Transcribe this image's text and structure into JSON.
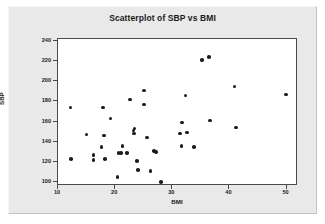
{
  "chart_data": {
    "type": "scatter",
    "title": "Scatterplot of SBP vs BMI",
    "xlabel": "BMI",
    "ylabel": "SBP",
    "xlim": [
      10,
      52
    ],
    "ylim": [
      96,
      242
    ],
    "xticks": [
      10,
      20,
      30,
      40,
      50
    ],
    "yticks": [
      100,
      120,
      140,
      160,
      180,
      200,
      220,
      240
    ],
    "grid": false,
    "legend": null,
    "marker_color": "#1c1c1c",
    "points": [
      {
        "x": 12.2,
        "y": 174
      },
      {
        "x": 12.3,
        "y": 123
      },
      {
        "x": 15.0,
        "y": 147
      },
      {
        "x": 16.2,
        "y": 127
      },
      {
        "x": 16.2,
        "y": 122
      },
      {
        "x": 17.6,
        "y": 135
      },
      {
        "x": 17.9,
        "y": 174
      },
      {
        "x": 18.0,
        "y": 146
      },
      {
        "x": 18.2,
        "y": 123
      },
      {
        "x": 19.2,
        "y": 163
      },
      {
        "x": 20.4,
        "y": 105
      },
      {
        "x": 20.6,
        "y": 129
      },
      {
        "x": 21.0,
        "y": 129
      },
      {
        "x": 21.3,
        "y": 136
      },
      {
        "x": 22.1,
        "y": 129
      },
      {
        "x": 22.6,
        "y": 182
      },
      {
        "x": 23.2,
        "y": 151
      },
      {
        "x": 23.3,
        "y": 148
      },
      {
        "x": 23.4,
        "y": 153
      },
      {
        "x": 23.8,
        "y": 121
      },
      {
        "x": 24.0,
        "y": 112
      },
      {
        "x": 25.0,
        "y": 191
      },
      {
        "x": 25.1,
        "y": 177
      },
      {
        "x": 25.6,
        "y": 144
      },
      {
        "x": 26.2,
        "y": 111
      },
      {
        "x": 26.8,
        "y": 131
      },
      {
        "x": 27.2,
        "y": 130
      },
      {
        "x": 28.0,
        "y": 100
      },
      {
        "x": 31.4,
        "y": 148
      },
      {
        "x": 31.6,
        "y": 136
      },
      {
        "x": 31.7,
        "y": 159
      },
      {
        "x": 32.3,
        "y": 186
      },
      {
        "x": 32.6,
        "y": 149
      },
      {
        "x": 33.8,
        "y": 135
      },
      {
        "x": 35.2,
        "y": 221
      },
      {
        "x": 36.4,
        "y": 224
      },
      {
        "x": 36.6,
        "y": 161
      },
      {
        "x": 40.9,
        "y": 195
      },
      {
        "x": 41.1,
        "y": 154
      },
      {
        "x": 49.9,
        "y": 187
      }
    ]
  }
}
